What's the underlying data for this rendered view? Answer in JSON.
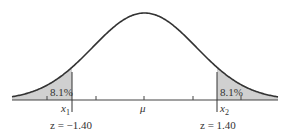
{
  "diagram": {
    "type": "normal-distribution",
    "left_tail": {
      "percent_label": "8.1%",
      "x_label": "x",
      "x_sub": "1",
      "z_label": "z = −1.40"
    },
    "right_tail": {
      "percent_label": "8.1%",
      "x_label": "x",
      "x_sub": "2",
      "z_label": "z = 1.40"
    },
    "center_label": "μ",
    "colors": {
      "curve": "#333333",
      "shade": "#d0d0d0",
      "axis": "#444444"
    }
  }
}
